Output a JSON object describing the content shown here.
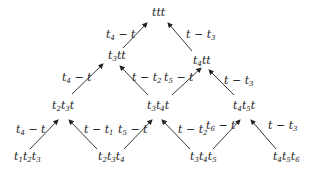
{
  "diagram": {
    "type": "tree-lattice",
    "nodes": [
      {
        "id": "top",
        "label": "ttt",
        "x": 162,
        "y": 13
      },
      {
        "id": "n_t3tt",
        "label": "t3tt",
        "x": 119,
        "y": 55
      },
      {
        "id": "n_t4tt",
        "label": "t4tt",
        "x": 203,
        "y": 60
      },
      {
        "id": "n_t2t3t",
        "label": "t2t3t",
        "x": 62,
        "y": 104
      },
      {
        "id": "n_t3t4t",
        "label": "t3t4t",
        "x": 160,
        "y": 104
      },
      {
        "id": "n_t4t5t",
        "label": "t4t5t",
        "x": 243,
        "y": 104
      },
      {
        "id": "n_t1t2t3",
        "label": "t1t2t3",
        "x": 27,
        "y": 157
      },
      {
        "id": "n_t2t3t4",
        "label": "t2t3t4",
        "x": 118,
        "y": 157
      },
      {
        "id": "n_t3t4t5",
        "label": "t3t4t5",
        "x": 202,
        "y": 157
      },
      {
        "id": "n_t4t5t6",
        "label": "t4t5t6",
        "x": 290,
        "y": 157
      }
    ],
    "edges": [
      {
        "from": "n_t3tt",
        "to": "top",
        "label": "t4 − t"
      },
      {
        "from": "n_t4tt",
        "to": "top",
        "label": "t − t3"
      },
      {
        "from": "n_t2t3t",
        "to": "n_t3tt",
        "label": "t4 − t"
      },
      {
        "from": "n_t3t4t",
        "to": "n_t3tt",
        "label": "t − t2"
      },
      {
        "from": "n_t3t4t",
        "to": "n_t4tt",
        "label": "t5 − t"
      },
      {
        "from": "n_t4t5t",
        "to": "n_t4tt",
        "label": "t − t3"
      },
      {
        "from": "n_t1t2t3",
        "to": "n_t2t3t",
        "label": "t4 − t"
      },
      {
        "from": "n_t2t3t4",
        "to": "n_t2t3t",
        "label": "t − t1"
      },
      {
        "from": "n_t2t3t4",
        "to": "n_t3t4t",
        "label": "t5 − t"
      },
      {
        "from": "n_t3t4t5",
        "to": "n_t3t4t",
        "label": "t − t2"
      },
      {
        "from": "n_t3t4t5",
        "to": "n_t4t5t",
        "label": "t6 − t"
      },
      {
        "from": "n_t4t5t6",
        "to": "n_t4t5t",
        "label": "t − t3"
      }
    ]
  },
  "text": {
    "top": "ttt",
    "t3tt": [
      "t",
      "3",
      "tt"
    ],
    "t4tt": [
      "t",
      "4",
      "tt"
    ],
    "t2t3t": [
      "t",
      "2",
      "t",
      "3",
      "t"
    ],
    "t3t4t": [
      "t",
      "3",
      "t",
      "4",
      "t"
    ],
    "t4t5t": [
      "t",
      "4",
      "t",
      "5",
      "t"
    ],
    "t1t2t3": [
      "t",
      "1",
      "t",
      "2",
      "t",
      "3"
    ],
    "t2t3t4": [
      "t",
      "2",
      "t",
      "3",
      "t",
      "4"
    ],
    "t3t4t5": [
      "t",
      "3",
      "t",
      "4",
      "t",
      "5"
    ],
    "t4t5t6": [
      "t",
      "4",
      "t",
      "5",
      "t",
      "6"
    ],
    "e1": [
      "t",
      "4",
      " − t"
    ],
    "e2": [
      "t − t",
      "3"
    ],
    "e3": [
      "t",
      "4",
      " − t"
    ],
    "e4": [
      "t − t",
      "2"
    ],
    "e5": [
      "t",
      "5",
      " − t"
    ],
    "e6": [
      "t − t",
      "3"
    ],
    "e7": [
      "t",
      "4",
      " − t"
    ],
    "e8": [
      "t − t",
      "1"
    ],
    "e9": [
      "t",
      "5",
      " − t"
    ],
    "e10": [
      "t − t",
      "2"
    ],
    "e11": [
      "t",
      "6",
      " − t"
    ],
    "e12": [
      "t − t",
      "3"
    ]
  },
  "colors": {
    "line": "#222222",
    "background": "#ffffff"
  }
}
